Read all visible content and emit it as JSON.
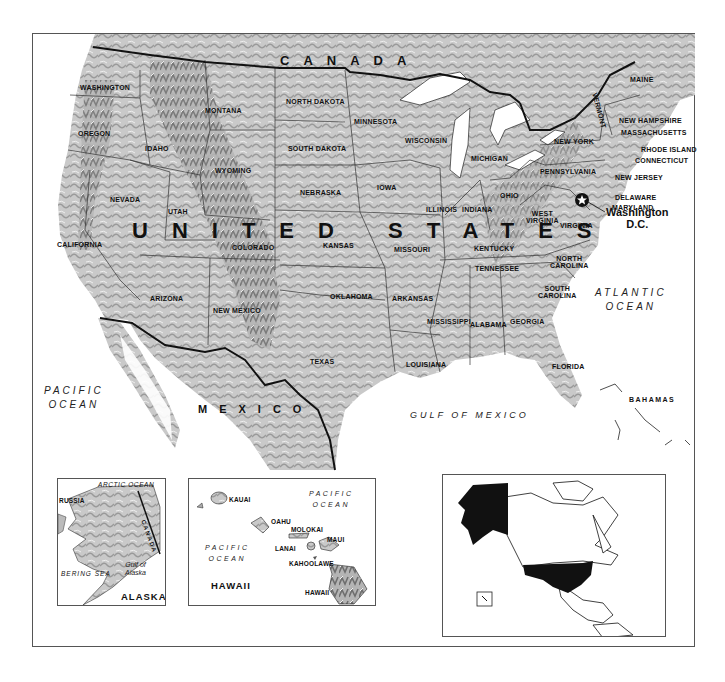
{
  "map": {
    "title": "United States",
    "country_label": "UNITED STATES",
    "neighbors": {
      "canada": "CANADA",
      "mexico": "MEXICO",
      "bahamas": "BAHAMAS"
    },
    "oceans": {
      "pacific": "PACIFIC\nOCEAN",
      "atlantic": "ATLANTIC\nOCEAN",
      "gulf": "GULF OF MEXICO"
    },
    "capital": {
      "name": "Washington\nD.C.",
      "symbol": "star-icon"
    },
    "states": [
      {
        "id": "washington",
        "label": "WASHINGTON",
        "x": 80,
        "y": 84
      },
      {
        "id": "oregon",
        "label": "OREGON",
        "x": 78,
        "y": 130
      },
      {
        "id": "idaho",
        "label": "IDAHO",
        "x": 145,
        "y": 145
      },
      {
        "id": "montana",
        "label": "MONTANA",
        "x": 205,
        "y": 107
      },
      {
        "id": "wyoming",
        "label": "WYOMING",
        "x": 215,
        "y": 167
      },
      {
        "id": "nevada",
        "label": "NEVADA",
        "x": 110,
        "y": 196
      },
      {
        "id": "utah",
        "label": "UTAH",
        "x": 168,
        "y": 208
      },
      {
        "id": "california",
        "label": "CALIFORNIA",
        "x": 57,
        "y": 241
      },
      {
        "id": "arizona",
        "label": "ARIZONA",
        "x": 150,
        "y": 295
      },
      {
        "id": "colorado",
        "label": "COLORADO",
        "x": 232,
        "y": 244
      },
      {
        "id": "new-mexico",
        "label": "NEW MEXICO",
        "x": 213,
        "y": 307
      },
      {
        "id": "north-dakota",
        "label": "NORTH DAKOTA",
        "x": 286,
        "y": 98
      },
      {
        "id": "south-dakota",
        "label": "SOUTH DAKOTA",
        "x": 288,
        "y": 145
      },
      {
        "id": "nebraska",
        "label": "NEBRASKA",
        "x": 300,
        "y": 189
      },
      {
        "id": "kansas",
        "label": "KANSAS",
        "x": 323,
        "y": 242
      },
      {
        "id": "oklahoma",
        "label": "OKLAHOMA",
        "x": 330,
        "y": 293
      },
      {
        "id": "texas",
        "label": "TEXAS",
        "x": 310,
        "y": 358
      },
      {
        "id": "minnesota",
        "label": "MINNESOTA",
        "x": 354,
        "y": 118
      },
      {
        "id": "iowa",
        "label": "IOWA",
        "x": 377,
        "y": 184
      },
      {
        "id": "missouri",
        "label": "MISSOURI",
        "x": 394,
        "y": 246
      },
      {
        "id": "arkansas",
        "label": "ARKANSAS",
        "x": 392,
        "y": 295
      },
      {
        "id": "louisiana",
        "label": "LOUISIANA",
        "x": 406,
        "y": 361
      },
      {
        "id": "wisconsin",
        "label": "WISCONSIN",
        "x": 405,
        "y": 137
      },
      {
        "id": "illinois",
        "label": "ILLINOIS",
        "x": 426,
        "y": 206
      },
      {
        "id": "michigan",
        "label": "MICHIGAN",
        "x": 471,
        "y": 155
      },
      {
        "id": "indiana",
        "label": "INDIANA",
        "x": 462,
        "y": 206
      },
      {
        "id": "ohio",
        "label": "OHIO",
        "x": 500,
        "y": 192
      },
      {
        "id": "kentucky",
        "label": "KENTUCKY",
        "x": 474,
        "y": 245
      },
      {
        "id": "tennessee",
        "label": "TENNESSEE",
        "x": 475,
        "y": 265
      },
      {
        "id": "mississippi",
        "label": "MISSISSIPPI",
        "x": 427,
        "y": 318
      },
      {
        "id": "alabama",
        "label": "ALABAMA",
        "x": 470,
        "y": 321
      },
      {
        "id": "georgia",
        "label": "GEORGIA",
        "x": 510,
        "y": 318
      },
      {
        "id": "florida",
        "label": "FLORIDA",
        "x": 552,
        "y": 363
      },
      {
        "id": "south-carolina",
        "label": "SOUTH\nCAROLINA",
        "x": 538,
        "y": 285
      },
      {
        "id": "north-carolina",
        "label": "NORTH\nCAROLINA",
        "x": 550,
        "y": 255
      },
      {
        "id": "virginia",
        "label": "VIRGINIA",
        "x": 560,
        "y": 222
      },
      {
        "id": "west-virginia",
        "label": "WEST\nVIRGINIA",
        "x": 526,
        "y": 210
      },
      {
        "id": "pennsylvania",
        "label": "PENNSYLVANIA",
        "x": 540,
        "y": 168
      },
      {
        "id": "new-york",
        "label": "NEW YORK",
        "x": 554,
        "y": 138
      },
      {
        "id": "vermont",
        "label": "VERMONT",
        "x": 598,
        "y": 92
      },
      {
        "id": "maine",
        "label": "MAINE",
        "x": 630,
        "y": 76
      },
      {
        "id": "new-hampshire",
        "label": "NEW HAMPSHIRE",
        "x": 619,
        "y": 117
      },
      {
        "id": "massachusetts",
        "label": "MASSACHUSETTS",
        "x": 621,
        "y": 129
      },
      {
        "id": "rhode-island",
        "label": "RHODE ISLAND",
        "x": 641,
        "y": 146
      },
      {
        "id": "connecticut",
        "label": "CONNECTICUT",
        "x": 635,
        "y": 157
      },
      {
        "id": "new-jersey",
        "label": "NEW JERSEY",
        "x": 615,
        "y": 174
      },
      {
        "id": "delaware",
        "label": "DELAWARE",
        "x": 615,
        "y": 194
      },
      {
        "id": "maryland",
        "label": "MARYLAND",
        "x": 612,
        "y": 204
      }
    ],
    "insets": {
      "alaska": {
        "title": "ALASKA",
        "arctic": "ARCTIC OCEAN",
        "russia": "RUSSIA",
        "canada": "CANADA",
        "bering": "BERING SEA",
        "gulf": "Gulf of\nAlaska"
      },
      "hawaii": {
        "title": "HAWAII",
        "ocean_ne": "PACIFIC\nOCEAN",
        "ocean_w": "PACIFIC\nOCEAN",
        "islands": [
          {
            "id": "kauai",
            "label": "KAUAI"
          },
          {
            "id": "oahu",
            "label": "OAHU"
          },
          {
            "id": "molokai",
            "label": "MOLOKAI"
          },
          {
            "id": "maui",
            "label": "MAUI"
          },
          {
            "id": "lanai",
            "label": "LANAI"
          },
          {
            "id": "kahoolawe",
            "label": "KAHOOLAWE"
          },
          {
            "id": "hawaii",
            "label": "HAWAII"
          }
        ]
      },
      "locator": {
        "highlight_color": "#111111",
        "regions": [
          "alaska",
          "contiguous-us",
          "hawaii-box"
        ]
      }
    },
    "colors": {
      "land": "#c8c8c8",
      "relief_dark": "#8a8a8a",
      "water": "#ffffff",
      "border": "#222222"
    }
  }
}
